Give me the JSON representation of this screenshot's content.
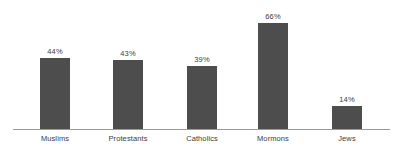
{
  "chart_data": {
    "type": "bar",
    "title": "",
    "subtitle": "",
    "xlabel": "",
    "ylabel": "",
    "grid": false,
    "legend": false,
    "axis_line": true,
    "ylim": [
      0,
      66
    ],
    "bar_color": "#4d4d4d",
    "axis_color": "#9a9a9a",
    "text_color": "#3c3c3c",
    "background": "#ffffff",
    "categories": [
      "Muslims",
      "Protestants",
      "Catholics",
      "Mormons",
      "Jews"
    ],
    "values": [
      44,
      43,
      39,
      66,
      14
    ],
    "value_labels": [
      "44%",
      "43%",
      "39%",
      "66%",
      "14%"
    ],
    "bars": [
      {
        "label": "Muslims",
        "value": 44,
        "value_label": "44%"
      },
      {
        "label": "Protestants",
        "value": 43,
        "value_label": "43%"
      },
      {
        "label": "Catholics",
        "value": 39,
        "value_label": "39%"
      },
      {
        "label": "Mormons",
        "value": 66,
        "value_label": "66%"
      },
      {
        "label": "Jews",
        "value": 14,
        "value_label": "14%"
      }
    ]
  }
}
